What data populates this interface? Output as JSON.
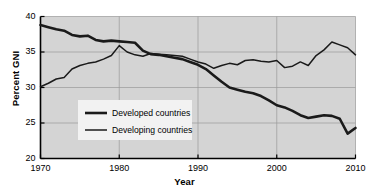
{
  "chart_data": {
    "type": "line",
    "title": "",
    "xlabel": "Year",
    "ylabel": "Percent GNI",
    "xlim": [
      1970,
      2010
    ],
    "ylim": [
      20,
      40
    ],
    "xticks": [
      1970,
      1980,
      1990,
      2000,
      2010
    ],
    "yticks": [
      20,
      25,
      30,
      35,
      40
    ],
    "grid": true,
    "legend_position": "center-left",
    "plot_background": "#d4d4d4",
    "line_color": "#1a1a1a",
    "x": [
      1970,
      1971,
      1972,
      1973,
      1974,
      1975,
      1976,
      1977,
      1978,
      1979,
      1980,
      1981,
      1982,
      1983,
      1984,
      1985,
      1986,
      1987,
      1988,
      1989,
      1990,
      1991,
      1992,
      1993,
      1994,
      1995,
      1996,
      1997,
      1998,
      1999,
      2000,
      2001,
      2002,
      2003,
      2004,
      2005,
      2006,
      2007,
      2008,
      2009,
      2010
    ],
    "series": [
      {
        "name": "Developed countries",
        "line_width": 2.6,
        "values": [
          38.8,
          38.5,
          38.2,
          38.0,
          37.4,
          37.2,
          37.3,
          36.7,
          36.5,
          36.6,
          36.5,
          36.4,
          36.3,
          35.2,
          34.7,
          34.6,
          34.4,
          34.2,
          34.0,
          33.6,
          33.2,
          32.6,
          31.7,
          30.8,
          30.0,
          29.7,
          29.4,
          29.2,
          28.8,
          28.2,
          27.5,
          27.2,
          26.7,
          26.1,
          25.7,
          25.9,
          26.1,
          26.0,
          25.6,
          23.5,
          24.3
        ]
      },
      {
        "name": "Developing countries",
        "line_width": 1.5,
        "values": [
          30.1,
          30.6,
          31.2,
          31.4,
          32.6,
          33.1,
          33.4,
          33.6,
          34.0,
          34.5,
          35.9,
          35.0,
          34.6,
          34.4,
          34.8,
          34.7,
          34.6,
          34.5,
          34.4,
          34.0,
          33.6,
          33.3,
          32.7,
          33.1,
          33.4,
          33.2,
          33.8,
          33.9,
          33.7,
          33.6,
          33.8,
          32.8,
          33.0,
          33.6,
          33.1,
          34.5,
          35.3,
          36.4,
          36.0,
          35.6,
          34.6
        ]
      }
    ]
  },
  "legend": {
    "items": [
      {
        "label": "Developed countries"
      },
      {
        "label": "Developing countries"
      }
    ]
  }
}
